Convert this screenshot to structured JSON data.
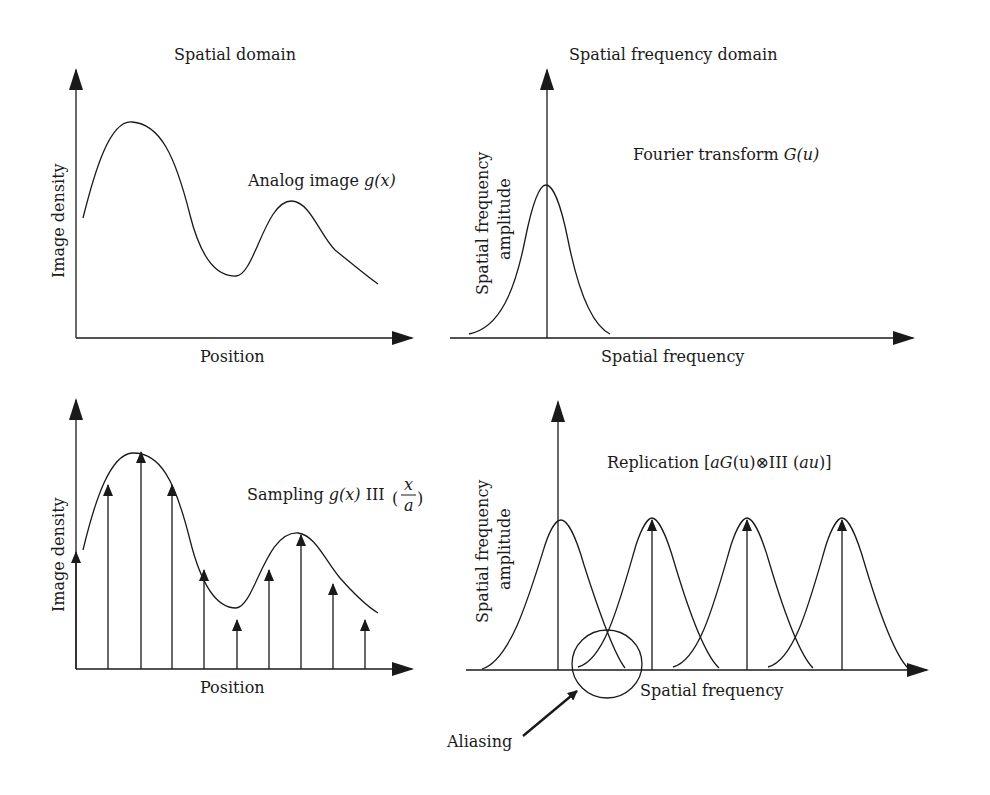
{
  "panels": {
    "top_left": {
      "title": "Spatial domain",
      "y_label": "Image density",
      "x_label": "Position",
      "curve_label_prefix": "Analog image ",
      "curve_label_math": "g(x)"
    },
    "top_right": {
      "title": "Spatial frequency domain",
      "y_label_line1": "Spatial frequency",
      "y_label_line2": "amplitude",
      "x_label": "Spatial frequency",
      "curve_label_prefix": "Fourier transform ",
      "curve_label_math": "G(u)"
    },
    "bottom_left": {
      "y_label": "Image density",
      "x_label": "Position",
      "curve_label_prefix": "Sampling ",
      "curve_label_math": "g(x)",
      "comb_symbol": "III",
      "frac_num": "x",
      "frac_den": "a",
      "sample_count": 10
    },
    "bottom_right": {
      "y_label_line1": "Spatial frequency",
      "y_label_line2": "amplitude",
      "x_label": "Spatial frequency",
      "curve_label_prefix": "Replication [",
      "curve_label_a": "aG",
      "curve_label_u": "(u)",
      "convolve_symbol": "⊗",
      "comb_symbol": "III (",
      "curve_label_au": "au",
      "curve_label_suffix": ")]",
      "annotation": "Aliasing",
      "replica_count": 4
    }
  },
  "colors": {
    "ink": "#1a1a1a",
    "background": "#ffffff"
  }
}
